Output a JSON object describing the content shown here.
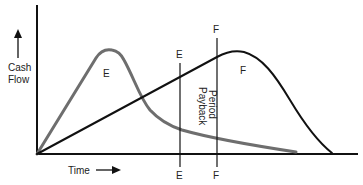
{
  "diagram": {
    "axes": {
      "y_label_line1": "Cash",
      "y_label_line2": "Flow",
      "x_label": "Time"
    },
    "curves": {
      "e_label": "E",
      "f_label": "F",
      "e_color": "#6e6e6e",
      "f_color": "#111111"
    },
    "markers": {
      "e_top": "E",
      "e_bottom": "E",
      "f_top": "F",
      "f_bottom": "F"
    },
    "annotation": {
      "line1": "Payback",
      "line2": "Period"
    }
  }
}
